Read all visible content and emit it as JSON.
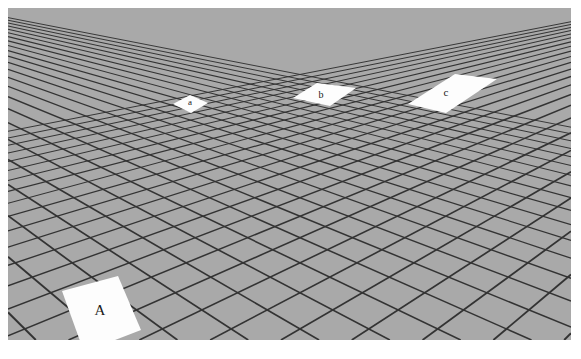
{
  "figure": {
    "name": "perspective-grid-size-illusion",
    "background_color": "#ffffff",
    "floor_color": "#a9a9a9",
    "grid_line_color": "#333333",
    "tile_fill_color": "#fdfdfd",
    "label_color": "#1a1a1a",
    "canvas": {
      "width": 581,
      "height": 359
    },
    "scene": {
      "left": 8,
      "top": 8,
      "width": 563,
      "height": 332,
      "horizon_y": -54,
      "vanishing_point_x": 300
    }
  },
  "tiles": [
    {
      "id": "tile-A",
      "label": "A",
      "label_x": 100,
      "label_y": 312,
      "label_class": "label-A",
      "polygon": "62,291 118,276 141,330 84,352",
      "depth": "near",
      "position": "bottom-left"
    },
    {
      "id": "tile-a",
      "label": "a",
      "label_x": 190,
      "label_y": 103,
      "label_class": "label-a",
      "polygon": "173,104 190,95 208,103 191,113",
      "depth": "far",
      "position": "upper-left"
    },
    {
      "id": "tile-b",
      "label": "b",
      "label_x": 321,
      "label_y": 96,
      "label_class": "label-b",
      "polygon": "293,98 317,83 356,88 330,106",
      "depth": "far",
      "position": "upper-center"
    },
    {
      "id": "tile-c",
      "label": "c",
      "label_x": 446,
      "label_y": 93,
      "label_class": "label-c",
      "polygon": "408,104 455,74 497,79 446,113",
      "depth": "far",
      "position": "upper-right"
    }
  ],
  "grid": {
    "description": "receding checkerboard floor rendered in one-point perspective",
    "left_family_count": 20,
    "right_family_count": 20,
    "line_width_near": 2.0,
    "line_width_far": 0.7
  }
}
